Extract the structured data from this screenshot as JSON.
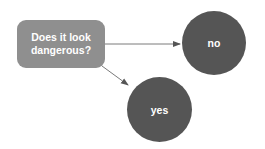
{
  "diagram": {
    "decision": {
      "label_line1": "Does it look",
      "label_line2": "dangerous?",
      "color": "#8f8f8f"
    },
    "nodes": [
      {
        "id": "no",
        "label": "no",
        "color": "#555555"
      },
      {
        "id": "yes",
        "label": "yes",
        "color": "#555555"
      }
    ],
    "edges": [
      {
        "from": "decision",
        "to": "no"
      },
      {
        "from": "decision",
        "to": "yes"
      }
    ],
    "edge_color": "#6a6a6a"
  }
}
